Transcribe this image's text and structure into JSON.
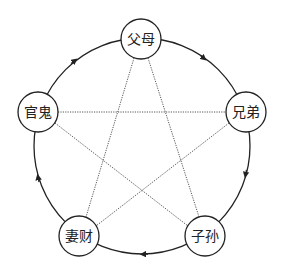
{
  "diagram": {
    "type": "five-element-relations-cycle",
    "colors": {
      "background": "#ffffff",
      "stroke": "#222222",
      "dotted_line": "#444444",
      "node_fill": "#ffffff"
    },
    "outer_circle": {
      "cx": 142,
      "cy": 146,
      "r": 108
    },
    "nodes": [
      {
        "id": "fumu",
        "label": "父母",
        "cx": 141,
        "cy": 39,
        "r": 20
      },
      {
        "id": "xiongdi",
        "label": "兄弟",
        "cx": 246,
        "cy": 112,
        "r": 20
      },
      {
        "id": "zisun",
        "label": "子孙",
        "cx": 205,
        "cy": 236,
        "r": 20
      },
      {
        "id": "qicai",
        "label": "妻财",
        "cx": 79,
        "cy": 236,
        "r": 20
      },
      {
        "id": "guangui",
        "label": "官鬼",
        "cx": 38,
        "cy": 112,
        "r": 20
      }
    ],
    "cycle_direction": "clockwise",
    "cycle_edges": [
      {
        "from": "父母",
        "to": "兄弟"
      },
      {
        "from": "兄弟",
        "to": "子孙"
      },
      {
        "from": "子孙",
        "to": "妻财"
      },
      {
        "from": "妻财",
        "to": "官鬼"
      },
      {
        "from": "官鬼",
        "to": "父母"
      }
    ],
    "star_edges": [
      {
        "from": "父母",
        "to": "妻财"
      },
      {
        "from": "父母",
        "to": "子孙"
      },
      {
        "from": "官鬼",
        "to": "兄弟"
      },
      {
        "from": "官鬼",
        "to": "子孙"
      },
      {
        "from": "兄弟",
        "to": "妻财"
      }
    ]
  }
}
